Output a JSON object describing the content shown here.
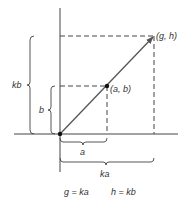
{
  "diagram": {
    "type": "vector-scaling",
    "colors": {
      "line": "#444444",
      "vector": "#555555",
      "background": "#ffffff"
    },
    "points": {
      "origin": {
        "label": ""
      },
      "ab": {
        "label": "(a, b)"
      },
      "gh": {
        "label": "(g, h)"
      }
    },
    "braces": {
      "kb": {
        "label": "kb"
      },
      "b": {
        "label": "b"
      },
      "a": {
        "label": "a"
      },
      "ka": {
        "label": "ka"
      }
    },
    "equations": [
      {
        "text": "g = ka"
      },
      {
        "text": "h = kb"
      }
    ]
  }
}
